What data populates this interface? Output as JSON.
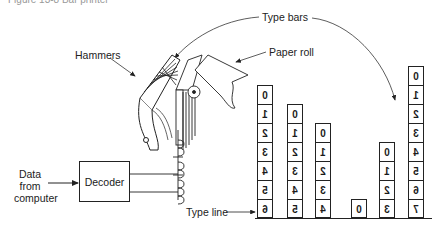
{
  "caption": "Figure 13-8 Bar printer",
  "labels": {
    "type_bars": "Type bars",
    "paper_roll": "Paper roll",
    "hammers": "Hammers",
    "data_from_computer": [
      "Data",
      "from",
      "computer"
    ],
    "decoder": "Decoder",
    "type_line": "Type line"
  },
  "type_bars": [
    {
      "x": 257,
      "cells": [
        "0",
        "1",
        "2",
        "3",
        "4",
        "5",
        "6"
      ]
    },
    {
      "x": 287,
      "cells": [
        "0",
        "1",
        "2",
        "3",
        "4",
        "5"
      ]
    },
    {
      "x": 315,
      "cells": [
        "0",
        "1",
        "2",
        "3",
        "4"
      ]
    },
    {
      "x": 351,
      "cells": [
        "0"
      ]
    },
    {
      "x": 379,
      "cells": [
        "0",
        "1",
        "2",
        "3"
      ]
    },
    {
      "x": 408,
      "cells": [
        "0",
        "1",
        "2",
        "3",
        "4",
        "5",
        "6",
        "7"
      ]
    }
  ],
  "note": "Digits on type bars are rendered mirror-reversed"
}
